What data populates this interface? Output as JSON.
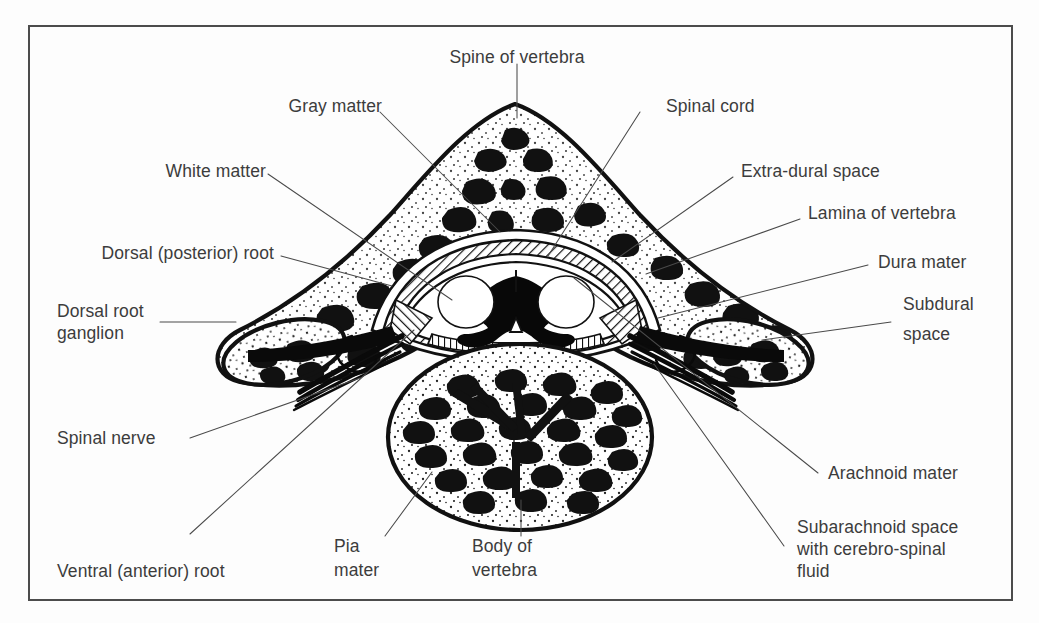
{
  "figure": {
    "border_color": "#4c4c4c",
    "ink_color": "#111111",
    "text_color": "#3c3c3c",
    "background_color": "#fdfdfd"
  },
  "labels": {
    "spine_of_vertebra": "Spine of vertebra",
    "gray_matter": "Gray matter",
    "spinal_cord": "Spinal cord",
    "white_matter": "White matter",
    "extra_dural_space": "Extra-dural space",
    "lamina_of_vertebra": "Lamina of vertebra",
    "dorsal_posterior_root": "Dorsal (posterior) root",
    "dura_mater": "Dura mater",
    "dorsal_root_ganglion_line1": "Dorsal root",
    "dorsal_root_ganglion_line2": "ganglion",
    "subdural_space_line1": "Subdural",
    "subdural_space_line2": "space",
    "spinal_nerve": "Spinal nerve",
    "arachnoid_mater": "Arachnoid mater",
    "ventral_anterior_root": "Ventral (anterior) root",
    "pia_mater_line1": "Pia",
    "pia_mater_line2": "mater",
    "body_of_vertebra_line1": "Body of",
    "body_of_vertebra_line2": "vertebra",
    "subarachnoid_line1": "Subarachnoid space",
    "subarachnoid_line2": "with cerebro-spinal",
    "subarachnoid_line3": "fluid"
  }
}
